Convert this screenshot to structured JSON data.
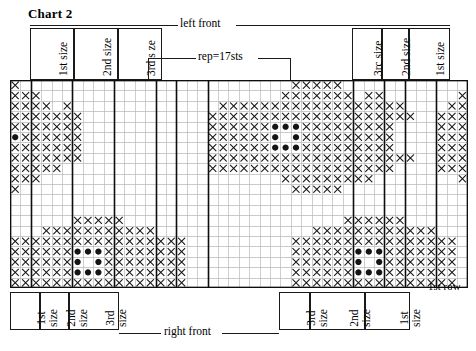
{
  "title": "Chart 2",
  "annotations": {
    "top_section": "left front",
    "bottom_section": "right front",
    "repeat": "rep=17sts",
    "first_row": "1st row"
  },
  "top_labels": [
    {
      "name": "1st size",
      "text": "1st size",
      "x": 30,
      "w": 44
    },
    {
      "name": "2nd size",
      "text": "2nd size",
      "x": 74,
      "w": 44
    },
    {
      "name": "3rd s ze",
      "text": "3rd s ze",
      "x": 118,
      "w": 44
    },
    {
      "name": "3rc size",
      "text": "3rc  size",
      "x": 352,
      "w": 30
    },
    {
      "name": "2nd size",
      "text": "2nd size",
      "x": 382,
      "w": 27
    },
    {
      "name": "1st size",
      "text": "1st size",
      "x": 409,
      "w": 41
    }
  ],
  "bottom_labels": [
    {
      "name": "1st size",
      "line1": "1st",
      "line2": "size",
      "x": 10,
      "w": 30
    },
    {
      "name": "2nd size",
      "line1": "2nd",
      "line2": "size",
      "x": 40,
      "w": 29
    },
    {
      "name": "3rd size",
      "line1": "3rd",
      "line2": "size",
      "x": 69,
      "w": 50
    },
    {
      "name": "3rd size",
      "line1": "3rd",
      "line2": "size",
      "x": 279,
      "w": 31
    },
    {
      "name": "2nd size",
      "line1": "2nd",
      "line2": "size",
      "x": 310,
      "w": 55
    },
    {
      "name": "1st size",
      "line1": "1st",
      "line2": "size",
      "x": 365,
      "w": 45
    }
  ],
  "symbols": {
    "cross": "x",
    "dot": "●",
    "blank": "",
    "triangle": "△",
    "legend_note": ""
  },
  "chart_data": {
    "type": "heatmap",
    "title": "Chart 2",
    "xlabel": "stitches",
    "ylabel": "rows",
    "cols": 44,
    "rows": 20,
    "cell_px": 10.4,
    "repeat_stitches": 17,
    "legend": [
      "x = knit symbol",
      "● = bobble/colour dot",
      "△ = alt symbol"
    ],
    "grid": [
      "x..........................xxxxx...........................",
      "xxx.......................xxxxxxx.xx.......xxxxxxxx....x..xx",
      "xxxx.x..............xxxxxxxxxxxxxxxxxx....xxxxxxxxxxxx..xxxx",
      "xxxxxxx............xxxxxxxxxxxxxxxxxxxx..xxxxxxxxxxxxxx.xxxx",
      "xxxxxxx............xxxxxxoooxxxxxxxxx....xxxxxxoooxxxxx.xxxx",
      "oxxxxxx............xxxxxxo.oxxxxxxxxx....xxxxxxo.oxxxxx.oooo",
      "xxxxxxx............xxxxxxoooxxxxxxxxx....xxxxxxoooxxxxx.xxxx",
      "xxxxxxx............xxxxxxxxxxxxxxxxxxxx..xxxxxxxxxxxxxx.xxxx",
      "xxxxx..............xxxxxxxxxxxxxxxxxx....xxxxxxxxxxxx...xxxx",
      "xxx.......................xxxxxxxxx........xxxxxxxx.....x.xx",
      "x..........................xxxxx...........................",
      "...........................................................",
      "..........................................................x",
      "......xxxxx.....................xxxxxx.............xxxxxxxx",
      "...xxxxxxxxxxx...............xxxxxxxxxxxx.......xxxxxxxxxxx",
      "xxxxxxxxxxxxxxxxx..........xxxxxxxxxxxxxxxx...xxxxxxxxxxxxx",
      "xxxxxxoooxxxxxxxx..........xxxxxxoooxxxxxxx...xxxxxxoooxxxx",
      "xxxxxxo.oxxxxxxxx..........xxxxxxo.oxxxxxxx...xxxxxxo.oxxxx",
      "xxxxxxoooxxxxxxxx..........xxxxxxoooxxxxxxx...xxxxxxoooxxxx",
      "xxxxxxxxxxxxxxxxx..........xxxxxxxxxxxxxxxx...xxxxxxxxxxxxx"
    ]
  },
  "grid_geometry": {
    "left": 10,
    "top": 80,
    "cell": 10.4,
    "cols": 44,
    "rows": 20,
    "thick_verticals": [
      2,
      6,
      10,
      14,
      16,
      19,
      33,
      36,
      38,
      41
    ],
    "top_box_verticals": [
      30,
      74,
      118,
      162,
      352,
      382,
      409,
      450
    ],
    "bottom_box_verticals": [
      10,
      40,
      69,
      119,
      279,
      310,
      365,
      410
    ]
  }
}
